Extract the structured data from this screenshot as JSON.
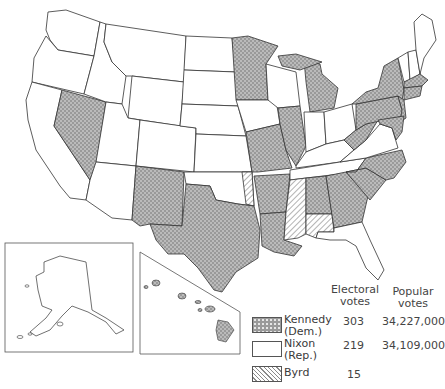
{
  "map": {
    "subject": "1960 U.S. presidential election results by state",
    "insets": [
      "Alaska",
      "Hawaii"
    ],
    "fill_colors": {
      "kennedy": "#9a9a9a",
      "nixon": "#ffffff",
      "byrd_hatch": "#8a8a8a",
      "outline": "#333333"
    },
    "states": {
      "kennedy": [
        "Nevada",
        "New Mexico",
        "Texas",
        "Minnesota",
        "Missouri",
        "Arkansas",
        "Louisiana",
        "Illinois",
        "Michigan",
        "West Virginia",
        "Pennsylvania",
        "New York",
        "New Jersey",
        "Delaware",
        "Maryland",
        "Massachusetts",
        "Rhode Island",
        "Connecticut",
        "North Carolina",
        "South Carolina",
        "Georgia",
        "Hawaii"
      ],
      "nixon": [
        "Washington",
        "Oregon",
        "California",
        "Idaho",
        "Montana",
        "Wyoming",
        "Utah",
        "Arizona",
        "Colorado",
        "North Dakota",
        "South Dakota",
        "Nebraska",
        "Kansas",
        "Oklahoma",
        "Iowa",
        "Wisconsin",
        "Indiana",
        "Ohio",
        "Kentucky",
        "Tennessee",
        "Virginia",
        "Florida",
        "Maine",
        "New Hampshire",
        "Vermont",
        "Alaska"
      ],
      "byrd": [
        "Mississippi",
        "Alabama (part)",
        "Oklahoma (1 elector)"
      ]
    }
  },
  "legend": {
    "headers": {
      "electoral": [
        "Electoral",
        "votes"
      ],
      "popular": [
        "Popular",
        "votes"
      ]
    },
    "entries": [
      {
        "name": "Kennedy",
        "party": "(Dem.)",
        "electoral": "303",
        "popular": "34,227,000",
        "pattern": "dots"
      },
      {
        "name": "Nixon",
        "party": "(Rep.)",
        "electoral": "219",
        "popular": "34,109,000",
        "pattern": "blank"
      },
      {
        "name": "Byrd",
        "party": "",
        "electoral": "15",
        "popular": "",
        "pattern": "hatch"
      }
    ]
  }
}
